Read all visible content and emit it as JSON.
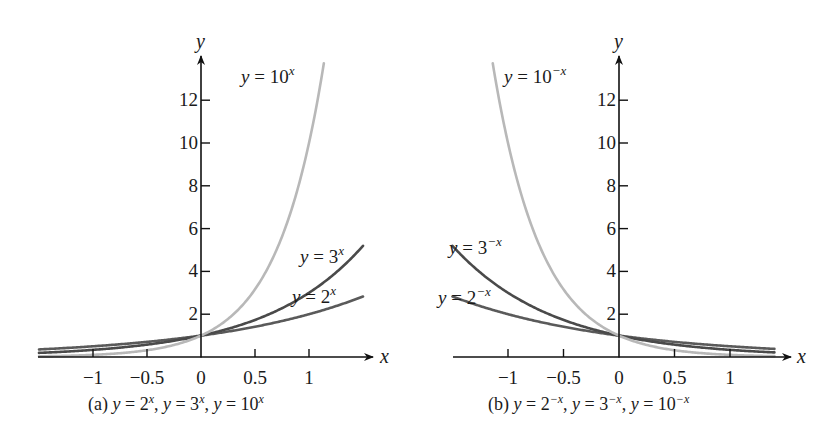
{
  "chart_data": [
    {
      "id": "a",
      "type": "line",
      "title": "",
      "caption": {
        "prefix": "(a)",
        "parts": [
          {
            "lhs": "y",
            "base": "2",
            "exp": "x"
          },
          {
            "lhs": "y",
            "base": "3",
            "exp": "x"
          },
          {
            "lhs": "y",
            "base": "10",
            "exp": "x"
          }
        ]
      },
      "xlabel": "x",
      "ylabel": "y",
      "xlim": [
        -1.5,
        1.55
      ],
      "ylim": [
        0,
        14
      ],
      "grid": false,
      "legend": "inline labels",
      "x_ticks": [
        -1,
        -0.5,
        0,
        0.5,
        1
      ],
      "x_tick_labels": [
        "−1",
        "−0.5",
        "0",
        "0.5",
        "1"
      ],
      "y_ticks": [
        2,
        4,
        6,
        8,
        10,
        12
      ],
      "y_tick_labels": [
        "2",
        "4",
        "6",
        "8",
        "10",
        "12"
      ],
      "series": [
        {
          "name": "y = 2^x",
          "base": 2,
          "sign": 1,
          "color": "#5a5a5a",
          "width": 2.6,
          "x": [
            -1.5,
            -1,
            -0.5,
            0,
            0.5,
            1,
            1.5
          ],
          "values": [
            0.35,
            0.5,
            0.71,
            1,
            1.41,
            2,
            2.83
          ],
          "label": {
            "lhs": "y",
            "base": "2",
            "exp": "x"
          }
        },
        {
          "name": "y = 3^x",
          "base": 3,
          "sign": 1,
          "color": "#4a4a4a",
          "width": 2.6,
          "x": [
            -1.5,
            -1,
            -0.5,
            0,
            0.5,
            1,
            1.5
          ],
          "values": [
            0.19,
            0.33,
            0.58,
            1,
            1.73,
            3,
            5.2
          ],
          "label": {
            "lhs": "y",
            "base": "3",
            "exp": "x"
          }
        },
        {
          "name": "y = 10^x",
          "base": 10,
          "sign": 1,
          "color": "#b8b8b8",
          "width": 2.6,
          "x": [
            -1.5,
            -1,
            -0.5,
            0,
            0.5,
            1,
            1.14
          ],
          "values": [
            0.03,
            0.1,
            0.32,
            1,
            3.16,
            10,
            13.9
          ],
          "label": {
            "lhs": "y",
            "base": "10",
            "exp": "x"
          }
        }
      ]
    },
    {
      "id": "b",
      "type": "line",
      "title": "",
      "caption": {
        "prefix": "(b)",
        "parts": [
          {
            "lhs": "y",
            "base": "2",
            "exp": "−x"
          },
          {
            "lhs": "y",
            "base": "3",
            "exp": "−x"
          },
          {
            "lhs": "y",
            "base": "10",
            "exp": "−x"
          }
        ]
      },
      "xlabel": "x",
      "ylabel": "y",
      "xlim": [
        -1.5,
        1.55
      ],
      "ylim": [
        0,
        14
      ],
      "grid": false,
      "legend": "inline labels",
      "x_ticks": [
        -1,
        -0.5,
        0,
        0.5,
        1
      ],
      "x_tick_labels": [
        "−1",
        "−0.5",
        "0",
        "0.5",
        "1"
      ],
      "y_ticks": [
        2,
        4,
        6,
        8,
        10,
        12
      ],
      "y_tick_labels": [
        "2",
        "4",
        "6",
        "8",
        "10",
        "12"
      ],
      "series": [
        {
          "name": "y = 2^-x",
          "base": 2,
          "sign": -1,
          "color": "#5a5a5a",
          "width": 2.6,
          "x": [
            -1.5,
            -1,
            -0.5,
            0,
            0.5,
            1,
            1.4
          ],
          "values": [
            2.83,
            2,
            1.41,
            1,
            0.71,
            0.5,
            0.38
          ],
          "label": {
            "lhs": "y",
            "base": "2",
            "exp": "−x"
          }
        },
        {
          "name": "y = 3^-x",
          "base": 3,
          "sign": -1,
          "color": "#4a4a4a",
          "width": 2.6,
          "x": [
            -1.5,
            -1,
            -0.5,
            0,
            0.5,
            1,
            1.4
          ],
          "values": [
            5.2,
            3,
            1.73,
            1,
            0.58,
            0.33,
            0.21
          ],
          "label": {
            "lhs": "y",
            "base": "3",
            "exp": "−x"
          }
        },
        {
          "name": "y = 10^-x",
          "base": 10,
          "sign": -1,
          "color": "#b8b8b8",
          "width": 2.6,
          "x": [
            -1.14,
            -1,
            -0.5,
            0,
            0.5,
            1,
            1.4
          ],
          "values": [
            13.9,
            10,
            3.16,
            1,
            0.32,
            0.1,
            0.04
          ],
          "label": {
            "lhs": "y",
            "base": "10",
            "exp": "−x"
          }
        }
      ]
    }
  ],
  "layout": {
    "panels": [
      {
        "origin": [
          201,
          357
        ],
        "sx": 108,
        "sy": 21.4,
        "x_axis": [
          38,
          373
        ],
        "y_axis_top": 56,
        "x_label_pos": [
          380,
          363
        ],
        "y_label_pos": [
          196,
          48
        ],
        "labels": [
          [
            292,
            303,
            "left"
          ],
          [
            300,
            263,
            "left"
          ],
          [
            241,
            83,
            "left"
          ]
        ],
        "caption_pos": [
          88,
          410
        ]
      },
      {
        "origin": [
          619,
          357
        ],
        "sx": 111,
        "sy": 21.4,
        "x_axis": [
          453,
          791
        ],
        "y_axis_top": 56,
        "x_label_pos": [
          797,
          363
        ],
        "y_label_pos": [
          614,
          48
        ],
        "labels": [
          [
            438,
            304,
            "left"
          ],
          [
            449,
            254,
            "left"
          ],
          [
            504,
            83,
            "left"
          ]
        ],
        "caption_pos": [
          488,
          410
        ]
      }
    ],
    "domain_min": [
      -1.5,
      -1.5
    ],
    "domain_max": [
      1.5,
      1.4
    ]
  }
}
